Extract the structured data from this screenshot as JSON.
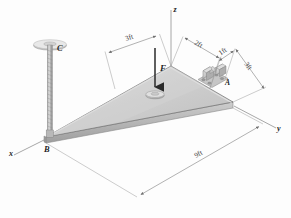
{
  "figure": {
    "type": "engineering-statics-free-body-diagram",
    "background_color": "#fdfdfd"
  },
  "axes": {
    "x_label": "x",
    "y_label": "y",
    "z_label": "z",
    "color": "#8a8a8a"
  },
  "points": {
    "a_label": "A",
    "b_label": "B",
    "c_label": "C"
  },
  "load": {
    "force_label": "F",
    "direction": "downward",
    "arrow_color": "#2a2a2a"
  },
  "dimensions": [
    {
      "id": "dim-left-3ft",
      "value": "3ft"
    },
    {
      "id": "dim-top-2ft",
      "value": "2ft"
    },
    {
      "id": "dim-top-1ft",
      "value": "1ft"
    },
    {
      "id": "dim-right-3ft",
      "value": "3ft"
    },
    {
      "id": "dim-bottom-9ft",
      "value": "9ft"
    }
  ],
  "colors": {
    "plate_top": "#c9c9c9",
    "plate_top_light": "#dcdcdc",
    "plate_edge": "#a8a8a8",
    "plate_side": "#b4b4b4",
    "cable": "#b0b0b0",
    "line": "#7d7d7d",
    "text": "#1d1d1d"
  }
}
